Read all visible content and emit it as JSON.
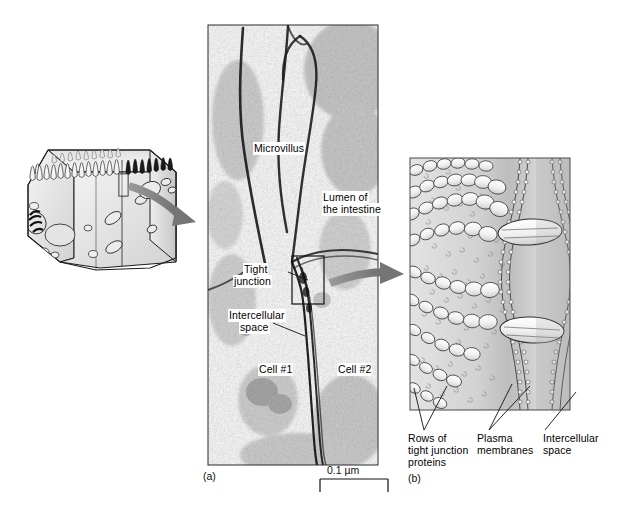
{
  "figure": {
    "panels": [
      {
        "tag": "(a)",
        "kind": "electron-micrograph"
      },
      {
        "tag": "(b)",
        "kind": "illustration"
      }
    ]
  },
  "panel_a": {
    "tag": "(a)",
    "labels": {
      "microvillus": "Microvillus",
      "lumen_line1": "Lumen of",
      "lumen_line2": "the intestine",
      "tight_junction_line1": "Tight",
      "tight_junction_line2": "junction",
      "intercellular_line1": "Intercellular",
      "intercellular_line2": "space",
      "cell1": "Cell #1",
      "cell2": "Cell #2"
    },
    "scale_bar": {
      "text": "0.1 µm",
      "value": 0.1,
      "unit": "µm"
    }
  },
  "panel_b": {
    "tag": "(b)",
    "labels": {
      "rows_line1": "Rows of",
      "rows_line2": "tight junction",
      "rows_line3": "proteins",
      "plasma_line1": "Plasma",
      "plasma_line2": "membranes",
      "intercellular_line1": "Intercellular",
      "intercellular_line2": "space"
    }
  },
  "cell_diagram": {
    "name": "intestinal-epithelial-cell-block",
    "features": [
      "microvilli",
      "nucleus",
      "mitochondria",
      "vesicles",
      "inset-box"
    ]
  },
  "colors": {
    "arrow": "#8a8a8a",
    "arrow_dark": "#6e6e6e",
    "cell_fill": "#e9e9e9",
    "cell_shade": "#c9c9c9",
    "panelb_fill": "#d8d8d8",
    "panelb_light": "#efefef",
    "ink": "#1a1a1a",
    "border": "#3a3a3a"
  }
}
